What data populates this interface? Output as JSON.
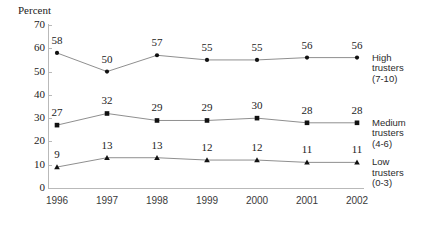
{
  "chart_data": {
    "type": "line",
    "title": "",
    "subtitle": "",
    "ylabel": "Percent",
    "xlabel": "",
    "ylim": [
      0,
      70
    ],
    "ytick_step": 10,
    "yticks": [
      "0",
      "10",
      "20",
      "30",
      "40",
      "50",
      "60",
      "70"
    ],
    "grid": false,
    "legend_position": "right",
    "categories": [
      "1996",
      "1997",
      "1998",
      "1999",
      "2000",
      "2001",
      "2002"
    ],
    "series": [
      {
        "name": "High trusters",
        "range": "(7-10)",
        "marker": "circle",
        "values": [
          58,
          50,
          57,
          55,
          55,
          56,
          56
        ],
        "labels": [
          "58",
          "50",
          "57",
          "55",
          "55",
          "56",
          "56"
        ]
      },
      {
        "name": "Medium trusters",
        "range": "(4-6)",
        "marker": "square",
        "values": [
          27,
          32,
          29,
          29,
          30,
          28,
          28
        ],
        "labels": [
          "27",
          "32",
          "29",
          "29",
          "30",
          "28",
          "28"
        ]
      },
      {
        "name": "Low trusters",
        "range": "(0-3)",
        "marker": "triangle",
        "values": [
          9,
          13,
          13,
          12,
          12,
          11,
          11
        ],
        "labels": [
          "9",
          "13",
          "13",
          "12",
          "12",
          "11",
          "11"
        ]
      }
    ],
    "colors": {
      "marker": "#111111",
      "line": "#8f8f8f",
      "axis": "#b9b9b9",
      "text": "#222222"
    }
  },
  "legend": [
    {
      "name": "High trusters",
      "line1": "High",
      "line2": "trusters",
      "range": "(7-10)"
    },
    {
      "name": "Medium trusters",
      "line1": "Medium",
      "line2": "trusters",
      "range": "(4-6)"
    },
    {
      "name": "Low trusters",
      "line1": "Low",
      "line2": "trusters",
      "range": "(0-3)"
    }
  ]
}
